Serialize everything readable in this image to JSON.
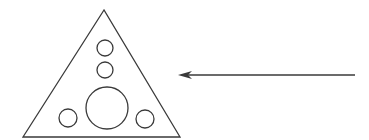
{
  "diagram": {
    "background": "#ffffff",
    "stroke_color": "#3a3a3a",
    "triangle": {
      "points": [
        [
          104,
          10
        ],
        [
          23,
          137
        ],
        [
          180,
          137
        ]
      ]
    },
    "circles": [
      {
        "name": "top-small",
        "cx": 105,
        "cy": 48,
        "r": 8
      },
      {
        "name": "middle-small",
        "cx": 105,
        "cy": 70,
        "r": 8
      },
      {
        "name": "center-large",
        "cx": 107,
        "cy": 108,
        "r": 21
      },
      {
        "name": "bottom-left-small",
        "cx": 68,
        "cy": 118,
        "r": 9
      },
      {
        "name": "bottom-right-small",
        "cx": 145,
        "cy": 119,
        "r": 9
      }
    ],
    "arrow": {
      "from": [
        355,
        75
      ],
      "to": [
        178,
        75
      ],
      "direction": "left"
    }
  }
}
